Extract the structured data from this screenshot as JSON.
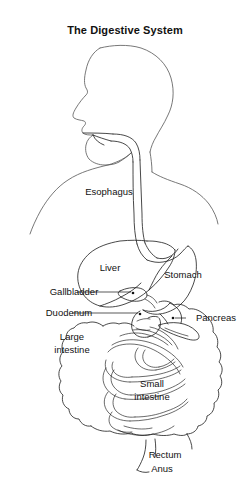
{
  "title": "The Digestive System",
  "figure": {
    "kind": "anatomical-diagram",
    "line_color": "#1a1a1a",
    "body_outline_color": "#555555",
    "background_color": "#ffffff"
  },
  "labels": {
    "esophagus": "Esophagus",
    "liver": "Liver",
    "stomach": "Stomach",
    "gallbladder": "Gallbladder",
    "duodenum": "Duodenum",
    "pancreas": "Pancreas",
    "large_intestine_line1": "Large",
    "large_intestine_line2": "intestine",
    "small_intestine_line1": "Small",
    "small_intestine_line2": "intestine",
    "rectum": "Rectum",
    "anus": "Anus"
  }
}
